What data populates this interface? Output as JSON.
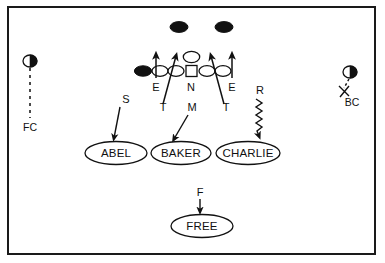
{
  "diagram": {
    "type": "football-play-diagram",
    "colors": {
      "ink": "#111111",
      "paper": "#ffffff",
      "frame": "#1a1a1a"
    },
    "offense": {
      "wide_receivers": [
        {
          "name": "wr-left",
          "x": 179,
          "y": 27
        },
        {
          "name": "wr-right",
          "x": 224,
          "y": 27
        }
      ],
      "tight_end": {
        "name": "tight-end",
        "x": 143,
        "y": 71
      },
      "linemen": [
        {
          "name": "lineman-1",
          "x": 160,
          "y": 71
        },
        {
          "name": "lineman-2",
          "x": 175,
          "y": 71
        },
        {
          "name": "lineman-3",
          "x": 206,
          "y": 71
        },
        {
          "name": "lineman-4",
          "x": 221,
          "y": 71
        }
      ],
      "center": {
        "name": "center",
        "x": 191,
        "y": 71
      },
      "quarterback": {
        "name": "quarterback",
        "x": 191,
        "y": 58
      }
    },
    "defense": {
      "line_labels": [
        {
          "key": "E-left",
          "text": "E",
          "x": 156,
          "y": 89
        },
        {
          "key": "N",
          "text": "N",
          "x": 191,
          "y": 89
        },
        {
          "key": "E-right",
          "text": "E",
          "x": 229,
          "y": 89
        }
      ],
      "tackle_labels": [
        {
          "key": "T-left",
          "text": "T",
          "x": 163,
          "y": 107
        },
        {
          "key": "T-right",
          "text": "T",
          "x": 224,
          "y": 107
        }
      ],
      "linebacker_labels": [
        {
          "key": "M",
          "text": "M",
          "x": 191,
          "y": 107
        },
        {
          "key": "S",
          "text": "S",
          "x": 125,
          "y": 100
        },
        {
          "key": "R",
          "text": "R",
          "x": 260,
          "y": 91
        },
        {
          "key": "F",
          "text": "F",
          "x": 199,
          "y": 193
        }
      ],
      "zones": [
        {
          "key": "abel",
          "text": "ABEL",
          "cx": 116,
          "cy": 153,
          "rx": 30,
          "ry": 11
        },
        {
          "key": "baker",
          "text": "BAKER",
          "cx": 181,
          "cy": 153,
          "rx": 29,
          "ry": 11
        },
        {
          "key": "charlie",
          "text": "CHARLIE",
          "cx": 248,
          "cy": 153,
          "rx": 31,
          "ry": 11
        },
        {
          "key": "free",
          "text": "FREE",
          "cx": 202,
          "cy": 226,
          "rx": 30,
          "ry": 11
        }
      ],
      "corners": [
        {
          "key": "fc",
          "text": "FC",
          "x": 30,
          "y": 128,
          "circle_x": 30,
          "circle_y": 61
        },
        {
          "key": "bc",
          "text": "BC",
          "x": 355,
          "y": 105,
          "circle_x": 349,
          "circle_y": 72
        }
      ]
    },
    "legend_text": {
      "abel": "ABEL",
      "baker": "BAKER",
      "charlie": "CHARLIE",
      "free": "FREE",
      "fc": "FC",
      "bc": "BC",
      "s": "S",
      "m": "M",
      "r": "R",
      "f": "F",
      "n": "N",
      "e_left": "E",
      "e_right": "E",
      "t_left": "T",
      "t_right": "T"
    }
  }
}
